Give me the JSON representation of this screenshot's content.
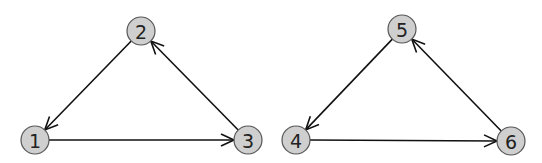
{
  "diagram": {
    "graphs": [
      {
        "name": "graph-left",
        "nodes": [
          {
            "id": "1",
            "label": "1",
            "x": 35,
            "y": 140
          },
          {
            "id": "2",
            "label": "2",
            "x": 141,
            "y": 31
          },
          {
            "id": "3",
            "label": "3",
            "x": 248,
            "y": 140
          }
        ],
        "edges": [
          {
            "from": "2",
            "to": "1"
          },
          {
            "from": "3",
            "to": "2"
          },
          {
            "from": "1",
            "to": "3"
          }
        ]
      },
      {
        "name": "graph-right",
        "nodes": [
          {
            "id": "4",
            "label": "4",
            "x": 296,
            "y": 140
          },
          {
            "id": "5",
            "label": "5",
            "x": 402,
            "y": 29
          },
          {
            "id": "6",
            "label": "6",
            "x": 511,
            "y": 141
          }
        ],
        "edges": [
          {
            "from": "5",
            "to": "4"
          },
          {
            "from": "6",
            "to": "5"
          },
          {
            "from": "4",
            "to": "6"
          }
        ]
      }
    ],
    "node_radius": 14,
    "colors": {
      "node_fill": "#cfcfcf",
      "node_stroke": "#555555",
      "edge": "#111111",
      "background": "#ffffff"
    }
  }
}
